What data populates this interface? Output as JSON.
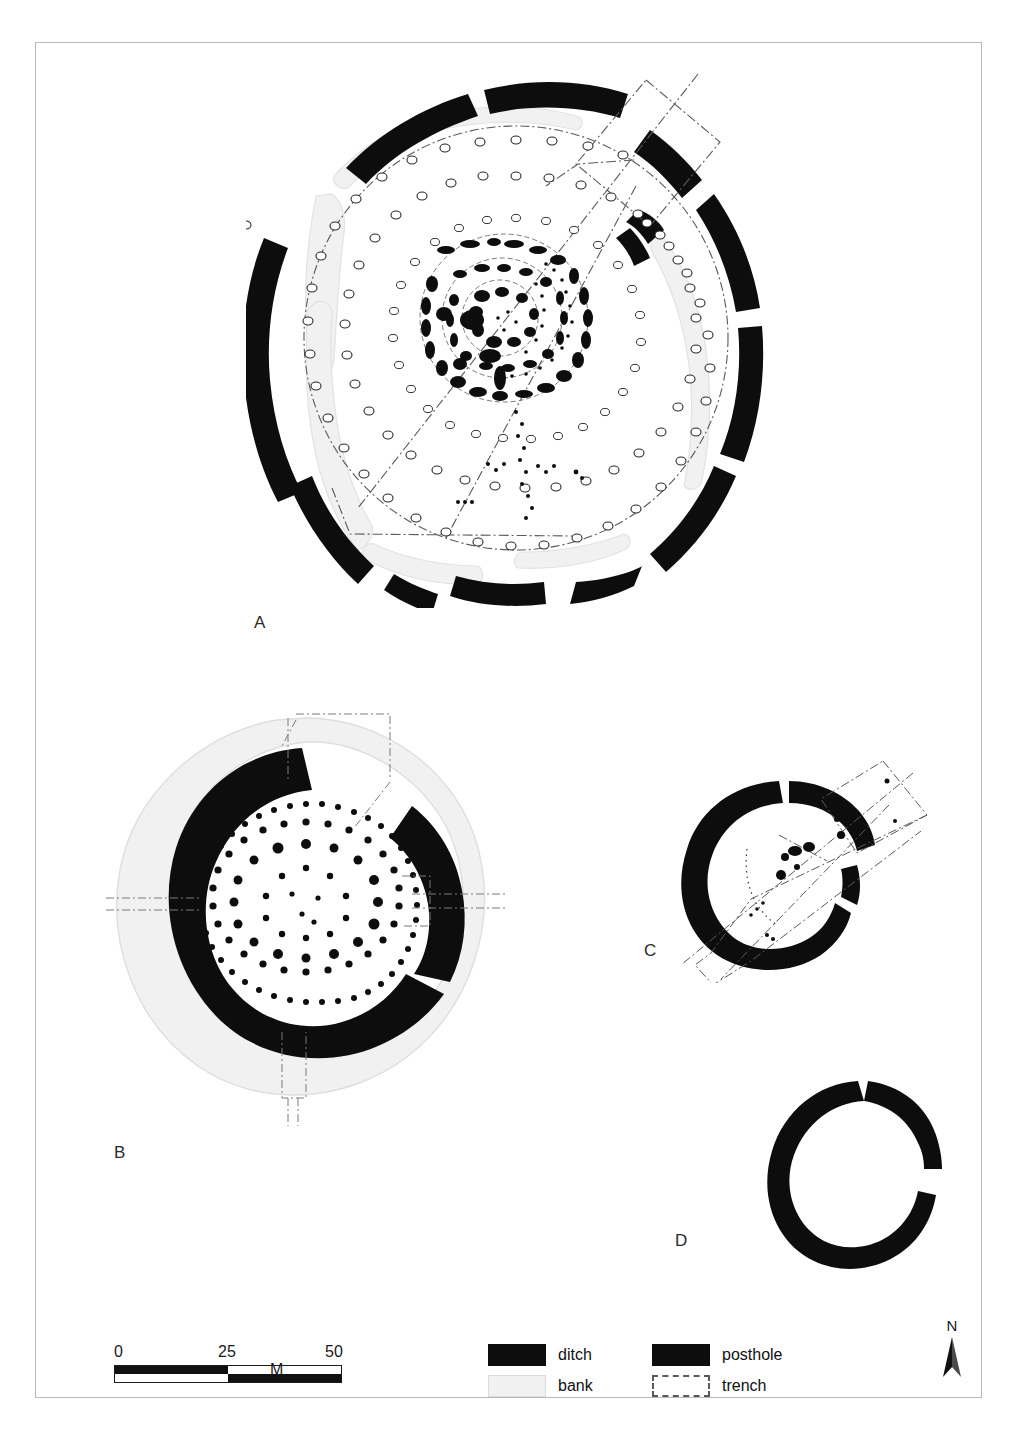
{
  "figure": {
    "panels": [
      {
        "id": "A",
        "label": "A"
      },
      {
        "id": "B",
        "label": "B"
      },
      {
        "id": "C",
        "label": "C"
      },
      {
        "id": "D",
        "label": "D"
      }
    ]
  },
  "scalebar": {
    "tick_0": "0",
    "tick_25": "25",
    "tick_50": "50",
    "unit": "M",
    "min": 0,
    "max": 50,
    "divisions": 2
  },
  "legend": {
    "items": [
      {
        "key": "ditch",
        "label": "ditch",
        "swatch": "solid-black",
        "color": "#0d0d0d"
      },
      {
        "key": "posthole",
        "label": "posthole",
        "swatch": "solid-black",
        "color": "#0d0d0d"
      },
      {
        "key": "bank",
        "label": "bank",
        "swatch": "light-grey",
        "color": "#f1f1f1"
      },
      {
        "key": "trench",
        "label": "trench",
        "swatch": "dash-dot-outline",
        "color": "#5a5a5a"
      }
    ]
  },
  "north_arrow": {
    "letter": "N",
    "icon": "north-arrow-icon"
  },
  "caption": {
    "text": ""
  },
  "colors": {
    "ditch": "#0d0d0d",
    "posthole": "#0d0d0d",
    "bank": "#f1f1f1",
    "bank_outline": "#dcdcdc",
    "trench": "#5a5a5a",
    "frame": "#b9b9b9",
    "background": "#ffffff"
  }
}
